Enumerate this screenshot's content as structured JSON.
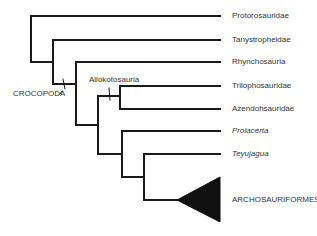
{
  "diagram": {
    "type": "cladogram",
    "line_color": "#1a1a1a",
    "taxa": [
      {
        "name": "Protorosauridae",
        "italic": false
      },
      {
        "name": "Tanystropheidae",
        "italic": false
      },
      {
        "name": "Rhynchosauria",
        "italic": false
      },
      {
        "name": "Trilophosauridae",
        "italic": false
      },
      {
        "name": "Azendohsauridae",
        "italic": false
      },
      {
        "name": "Prolacerta",
        "italic": true
      },
      {
        "name": "Teyujagua",
        "italic": true
      },
      {
        "name": "ARCHOSAURIFORMES",
        "italic": false,
        "collapsed_clade": true
      }
    ],
    "clade_labels": [
      {
        "name": "CROCOPODA"
      },
      {
        "name": "Allokotosauria"
      }
    ]
  }
}
